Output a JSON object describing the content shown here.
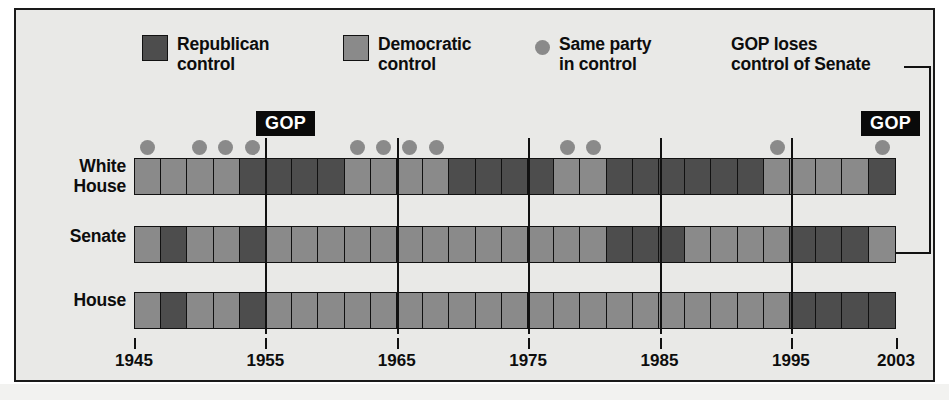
{
  "legend": {
    "republican": {
      "label": "Republican\ncontrol",
      "color": "#4d4d4d",
      "icon": "square-swatch-icon"
    },
    "democratic": {
      "label": "Democratic\ncontrol",
      "color": "#8a8a8a",
      "icon": "square-swatch-icon"
    },
    "same_party": {
      "label": "Same party\nin control",
      "color": "#8a8a8a",
      "icon": "circle-dot-icon"
    },
    "annotation": {
      "label": "GOP loses\ncontrol of Senate"
    }
  },
  "callouts": [
    {
      "label": "GOP",
      "year": 1954
    },
    {
      "label": "GOP",
      "year": 2001
    }
  ],
  "rows": {
    "white_house": "White\nHouse",
    "senate": "Senate",
    "house": "House"
  },
  "axis": {
    "ticks": [
      1945,
      1955,
      1965,
      1975,
      1985,
      1995,
      2003
    ],
    "labels": [
      "1945",
      "1955",
      "1965",
      "1975",
      "1985",
      "1995",
      "2003"
    ],
    "gridlines": [
      1955,
      1965,
      1975,
      1985,
      1995
    ],
    "start": 1945,
    "end": 2003
  },
  "chart_data": {
    "type": "heatmap",
    "xlabel": "",
    "ylabel": "",
    "xlim": [
      1945,
      2003
    ],
    "grid": true,
    "legend_position": "top",
    "period_years": 2,
    "categories": [
      "1945",
      "1947",
      "1949",
      "1951",
      "1953",
      "1955",
      "1957",
      "1959",
      "1961",
      "1963",
      "1965",
      "1967",
      "1969",
      "1971",
      "1973",
      "1975",
      "1977",
      "1979",
      "1981",
      "1983",
      "1985",
      "1987",
      "1989",
      "1991",
      "1993",
      "1995",
      "1997",
      "1999",
      "2001"
    ],
    "series": [
      {
        "name": "White House",
        "values": [
          "dem",
          "dem",
          "dem",
          "dem",
          "rep",
          "rep",
          "rep",
          "rep",
          "dem",
          "dem",
          "dem",
          "dem",
          "rep",
          "rep",
          "rep",
          "rep",
          "dem",
          "dem",
          "rep",
          "rep",
          "rep",
          "rep",
          "rep",
          "rep",
          "dem",
          "dem",
          "dem",
          "dem",
          "rep"
        ]
      },
      {
        "name": "Senate",
        "values": [
          "dem",
          "rep",
          "dem",
          "dem",
          "rep",
          "dem",
          "dem",
          "dem",
          "dem",
          "dem",
          "dem",
          "dem",
          "dem",
          "dem",
          "dem",
          "dem",
          "dem",
          "dem",
          "rep",
          "rep",
          "rep",
          "dem",
          "dem",
          "dem",
          "dem",
          "rep",
          "rep",
          "rep",
          "dem"
        ]
      },
      {
        "name": "House",
        "values": [
          "dem",
          "rep",
          "dem",
          "dem",
          "rep",
          "dem",
          "dem",
          "dem",
          "dem",
          "dem",
          "dem",
          "dem",
          "dem",
          "dem",
          "dem",
          "dem",
          "dem",
          "dem",
          "dem",
          "dem",
          "dem",
          "dem",
          "dem",
          "dem",
          "dem",
          "rep",
          "rep",
          "rep",
          "rep"
        ]
      }
    ],
    "same_party_markers": [
      1946,
      1950,
      1952,
      1954,
      1962,
      1964,
      1966,
      1968,
      1978,
      1980,
      1994,
      2002
    ],
    "annotations": [
      {
        "text": "GOP",
        "year": 1954
      },
      {
        "text": "GOP",
        "year": 2001
      },
      {
        "text": "GOP loses control of Senate",
        "year": 2001,
        "target_row": "Senate"
      }
    ]
  }
}
